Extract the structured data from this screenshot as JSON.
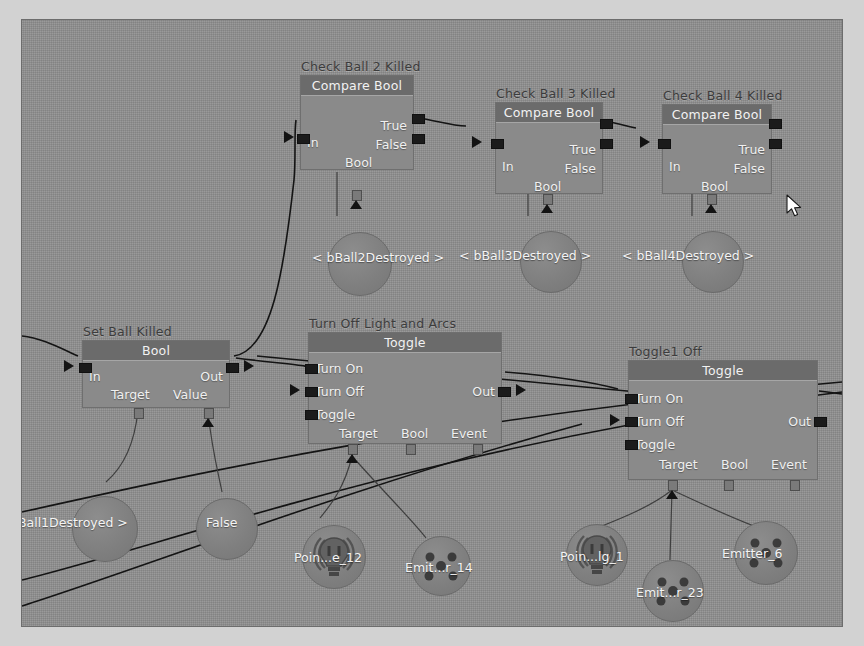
{
  "app": {
    "type": "visual-scripting-graph-editor",
    "background_color": "#8e8e8e",
    "frame_color": "#d2d2d2"
  },
  "nodes": [
    {
      "id": "check-ball-2",
      "title": "Check Ball 2 Killed",
      "header": "Compare Bool",
      "inputs": [
        "In"
      ],
      "outputs": [
        "True",
        "False"
      ],
      "bottom_pins": [
        "Bool"
      ],
      "x": 300,
      "y": 75,
      "w": 114,
      "h": 95
    },
    {
      "id": "check-ball-3",
      "title": "Check Ball 3 Killed",
      "header": "Compare Bool",
      "inputs": [
        "In"
      ],
      "outputs": [
        "True",
        "False"
      ],
      "bottom_pins": [
        "Bool"
      ],
      "x": 474,
      "y": 80,
      "w": 108,
      "h": 92
    },
    {
      "id": "check-ball-4",
      "title": "Check Ball 4 Killed",
      "header": "Compare Bool",
      "inputs": [
        "In"
      ],
      "outputs": [
        "True",
        "False"
      ],
      "bottom_pins": [
        "Bool"
      ],
      "x": 642,
      "y": 82,
      "w": 110,
      "h": 90
    },
    {
      "id": "set-ball-killed",
      "title": "Set Ball Killed",
      "header": "Bool",
      "inputs": [
        "In"
      ],
      "outputs": [
        "Out"
      ],
      "bottom_pins": [
        "Target",
        "Value"
      ],
      "x": 82,
      "y": 340,
      "w": 148,
      "h": 68
    },
    {
      "id": "turn-off-light-and-arcs",
      "title": "Turn Off Light and Arcs",
      "header": "Toggle",
      "inputs": [
        "Turn On",
        "Turn Off",
        "Toggle"
      ],
      "outputs": [
        "Out"
      ],
      "bottom_pins": [
        "Target",
        "Bool",
        "Event"
      ],
      "x": 305,
      "y": 312,
      "w": 194,
      "h": 117
    },
    {
      "id": "toggle1-off",
      "title": "Toggle1 Off",
      "header": "Toggle",
      "inputs": [
        "Turn On",
        "Turn Off",
        "Toggle"
      ],
      "outputs": [
        "Out"
      ],
      "bottom_pins": [
        "Target",
        "Bool",
        "Event"
      ],
      "x": 625,
      "y": 335,
      "w": 190,
      "h": 125
    }
  ],
  "variables": [
    {
      "id": "bball2",
      "label": "< bBall2Destroyed >",
      "cx": 337,
      "cy": 243,
      "r": 31
    },
    {
      "id": "bball3",
      "label": "< bBall3Destroyed >",
      "cx": 528,
      "cy": 241,
      "r": 30
    },
    {
      "id": "bball4",
      "label": "< bBall4Destroyed >",
      "cx": 690,
      "cy": 241,
      "r": 30
    },
    {
      "id": "bball1",
      "label": "bBall1Destroyed >",
      "cx": 82,
      "cy": 508,
      "r": 32
    },
    {
      "id": "false",
      "label": "False",
      "cx": 204,
      "cy": 508,
      "r": 30
    }
  ],
  "assets": [
    {
      "id": "point-light-12",
      "label": "Poin...e_12",
      "icon": "point-light-icon",
      "cx": 311,
      "cy": 536,
      "r": 31
    },
    {
      "id": "emitter-14",
      "label": "Emit...r_14",
      "icon": "emitter-icon",
      "cx": 418,
      "cy": 545,
      "r": 29
    },
    {
      "id": "point-light-1",
      "label": "Poin...lg_1",
      "icon": "point-light-icon",
      "cx": 574,
      "cy": 534,
      "r": 30
    },
    {
      "id": "emitter-23",
      "label": "Emit...r_23",
      "icon": "emitter-icon",
      "cx": 650,
      "cy": 570,
      "r": 30
    },
    {
      "id": "emitter-6",
      "label": "Emitter_6",
      "icon": "emitter-icon",
      "cx": 743,
      "cy": 532,
      "r": 31
    }
  ],
  "cursor": {
    "x": 786,
    "y": 194,
    "type": "arrow-pointer"
  }
}
